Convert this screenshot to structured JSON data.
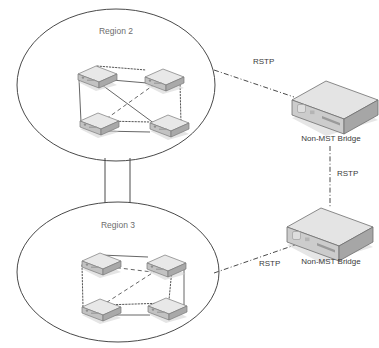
{
  "diagram": {
    "background_color": "#ffffff",
    "line_color": "#4a4a4a",
    "label_color": "#6d6d6d",
    "device_fill_light": "#e8e8e8",
    "device_fill_mid": "#c2c2c2",
    "device_fill_dark": "#a9a9a9"
  },
  "regions": [
    {
      "id": "region-2",
      "label": "Region 2",
      "label_x": 116,
      "label_y": 34,
      "ellipse": {
        "cx": 116,
        "cy": 85,
        "rx": 99,
        "ry": 76
      },
      "switches": [
        {
          "id": "r2-sw-tl",
          "x": 76,
          "y": 65
        },
        {
          "id": "r2-sw-tr",
          "x": 143,
          "y": 68
        },
        {
          "id": "r2-sw-bl",
          "x": 78,
          "y": 112
        },
        {
          "id": "r2-sw-br",
          "x": 148,
          "y": 114
        }
      ],
      "links": [
        {
          "from": "r2-sw-tl",
          "to": "r2-sw-tr",
          "style": "dotted"
        },
        {
          "from": "r2-sw-tl",
          "to": "r2-sw-tr",
          "style": "solid"
        },
        {
          "from": "r2-sw-tl",
          "to": "r2-sw-bl",
          "style": "solid"
        },
        {
          "from": "r2-sw-tr",
          "to": "r2-sw-br",
          "style": "dotted"
        },
        {
          "from": "r2-sw-bl",
          "to": "r2-sw-br",
          "style": "dotted"
        },
        {
          "from": "r2-sw-bl",
          "to": "r2-sw-br",
          "style": "solid"
        },
        {
          "from": "r2-sw-tl",
          "to": "r2-sw-br",
          "style": "solid"
        },
        {
          "from": "r2-sw-tr",
          "to": "r2-sw-bl",
          "style": "dashed"
        }
      ]
    },
    {
      "id": "region-3",
      "label": "Region 3",
      "label_x": 118,
      "label_y": 228,
      "ellipse": {
        "cx": 118,
        "cy": 272,
        "rx": 101,
        "ry": 70
      },
      "switches": [
        {
          "id": "r3-sw-tl",
          "x": 80,
          "y": 252
        },
        {
          "id": "r3-sw-tr",
          "x": 145,
          "y": 254
        },
        {
          "id": "r3-sw-bl",
          "x": 80,
          "y": 298
        },
        {
          "id": "r3-sw-br",
          "x": 146,
          "y": 297
        }
      ],
      "links": [
        {
          "from": "r3-sw-tl",
          "to": "r3-sw-tr",
          "style": "solid"
        },
        {
          "from": "r3-sw-tl",
          "to": "r3-sw-bl",
          "style": "dotted"
        },
        {
          "from": "r3-sw-tr",
          "to": "r3-sw-br",
          "style": "solid"
        },
        {
          "from": "r3-sw-tr",
          "to": "r3-sw-br",
          "style": "dotted"
        },
        {
          "from": "r3-sw-bl",
          "to": "r3-sw-br",
          "style": "solid"
        },
        {
          "from": "r3-sw-bl",
          "to": "r3-sw-br",
          "style": "dotted"
        },
        {
          "from": "r3-sw-tl",
          "to": "r3-sw-br",
          "style": "dashed-short"
        },
        {
          "from": "r3-sw-tr",
          "to": "r3-sw-bl",
          "style": "dashed"
        }
      ]
    }
  ],
  "trunk": {
    "name": "region-interconnect",
    "left_x": 105,
    "right_x": 130,
    "top_y": 158,
    "bottom_y": 203
  },
  "bridges": [
    {
      "id": "bridge-top",
      "label": "Non-MST Bridge",
      "label_x": 331,
      "label_y": 141,
      "x": 286,
      "y": 78
    },
    {
      "id": "bridge-bottom",
      "label": "Non-MST Bridge",
      "label_x": 331,
      "label_y": 264,
      "x": 281,
      "y": 205
    }
  ],
  "rstp_links": [
    {
      "id": "rstp-region2-to-bridge-top",
      "label": "RSTP",
      "label_x": 253,
      "label_y": 64,
      "x1": 214,
      "y1": 70,
      "x2": 294,
      "y2": 97
    },
    {
      "id": "rstp-bridge-top-to-bridge-bottom",
      "label": "RSTP",
      "label_x": 337,
      "label_y": 176,
      "x1": 330,
      "y1": 146,
      "x2": 330,
      "y2": 208
    },
    {
      "id": "rstp-region3-to-bridge-bottom",
      "label": "RSTP",
      "label_x": 259,
      "label_y": 266,
      "x1": 214,
      "y1": 273,
      "x2": 295,
      "y2": 245
    }
  ]
}
